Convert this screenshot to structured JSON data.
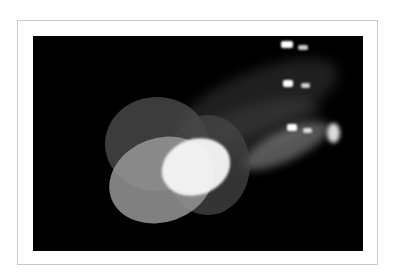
{
  "image": {
    "description": "Photograph of three stage spotlights projecting overlapping light circles on a black background, shown in a white bordered frame",
    "colors": {
      "background": "#ffffff",
      "frame_border": "#c8c8c8",
      "photo_background": "#000000"
    }
  }
}
